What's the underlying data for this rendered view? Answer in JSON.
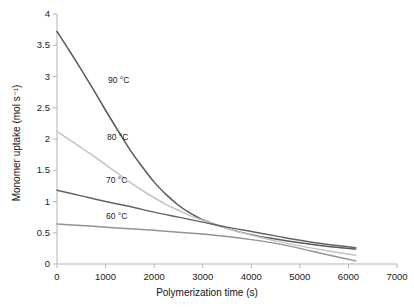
{
  "chart_data": {
    "type": "line",
    "title": "",
    "xlabel": "Polymerization time (s)",
    "ylabel": "Monomer uptake (mol s⁻¹)",
    "xlim": [
      0,
      7000
    ],
    "ylim": [
      0,
      4
    ],
    "xticks": [
      0,
      1000,
      2000,
      3000,
      4000,
      5000,
      6000,
      7000
    ],
    "xtick_labels": [
      "0",
      "1000",
      "2000",
      "3000",
      "4000",
      "5000",
      "6000",
      "7000"
    ],
    "yticks": [
      0,
      0.5,
      1,
      1.5,
      2,
      2.5,
      3,
      3.5,
      4
    ],
    "ytick_labels": [
      "0",
      "0.5",
      "1",
      "1.5",
      "2",
      "2.5",
      "3",
      "3.5",
      "4"
    ],
    "grid": false,
    "legend_position": "inline-annotations",
    "series": [
      {
        "name": "90 °C",
        "label": "90 °C",
        "color": "#595959",
        "label_x": 1050,
        "label_y": 2.93,
        "x": [
          0,
          250,
          500,
          750,
          1000,
          1250,
          1500,
          1750,
          2000,
          2250,
          2500,
          2750,
          3000,
          3500,
          4000,
          4500,
          5000,
          5500,
          6150
        ],
        "y": [
          3.72,
          3.42,
          3.11,
          2.79,
          2.46,
          2.14,
          1.83,
          1.56,
          1.31,
          1.11,
          0.94,
          0.81,
          0.71,
          0.57,
          0.47,
          0.4,
          0.34,
          0.29,
          0.24
        ]
      },
      {
        "name": "80 °C",
        "label": "80 °C",
        "color": "#c4c4c4",
        "label_x": 1030,
        "label_y": 2.02,
        "x": [
          0,
          250,
          500,
          750,
          1000,
          1250,
          1500,
          1750,
          2000,
          2250,
          2500,
          2750,
          3000,
          3500,
          4000,
          4500,
          5000,
          5500,
          6150
        ],
        "y": [
          2.12,
          1.99,
          1.86,
          1.73,
          1.59,
          1.45,
          1.31,
          1.18,
          1.06,
          0.95,
          0.86,
          0.77,
          0.7,
          0.57,
          0.46,
          0.37,
          0.29,
          0.22,
          0.14
        ]
      },
      {
        "name": "70 °C",
        "label": "70 °C",
        "color": "#636363",
        "label_x": 1010,
        "label_y": 1.33,
        "x": [
          0,
          500,
          1000,
          1500,
          2000,
          2500,
          3000,
          3500,
          4000,
          4500,
          5000,
          5500,
          6150
        ],
        "y": [
          1.18,
          1.09,
          1.0,
          0.92,
          0.83,
          0.75,
          0.67,
          0.59,
          0.52,
          0.45,
          0.38,
          0.32,
          0.26
        ]
      },
      {
        "name": "60 °C",
        "label": "60 °C",
        "color": "#939393",
        "label_x": 1010,
        "label_y": 0.76,
        "x": [
          0,
          500,
          1000,
          1500,
          2000,
          2500,
          3000,
          3500,
          4000,
          4500,
          5000,
          5500,
          6150
        ],
        "y": [
          0.64,
          0.615,
          0.59,
          0.565,
          0.54,
          0.51,
          0.48,
          0.44,
          0.39,
          0.33,
          0.25,
          0.16,
          0.05
        ]
      }
    ]
  },
  "axes": {
    "x_title": "Polymerization time (s)",
    "y_title": "Monomer uptake (mol s⁻¹)"
  }
}
